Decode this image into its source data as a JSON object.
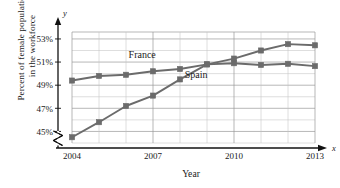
{
  "chart_data": {
    "type": "line",
    "title": "",
    "xlabel": "Year",
    "ylabel_line1": "Percent of female population",
    "ylabel_line2": "in the workforce",
    "x_axis_name": "x",
    "y_axis_name": "y",
    "x": [
      2004,
      2005,
      2006,
      2007,
      2008,
      2009,
      2010,
      2011,
      2012,
      2013
    ],
    "xtick_labels": [
      "2004",
      "2007",
      "2010",
      "2013"
    ],
    "xticks": [
      2004,
      2007,
      2010,
      2013
    ],
    "ytick_labels": [
      "45%",
      "47%",
      "49%",
      "51%",
      "53%"
    ],
    "yticks": [
      45,
      47,
      49,
      51,
      53
    ],
    "xlim": [
      2004,
      2013
    ],
    "ylim": [
      44,
      53.6
    ],
    "grid": true,
    "grid_minor_y_step": 1,
    "axis_break": true,
    "legend_position": "inline-annotations",
    "series": [
      {
        "name": "France",
        "color": "#6b6b6b",
        "label_x": 2006.6,
        "label_y": 51.35,
        "values": [
          49.4,
          49.8,
          49.9,
          50.2,
          50.4,
          50.8,
          50.9,
          50.75,
          50.85,
          50.65
        ]
      },
      {
        "name": "Spain",
        "color": "#6b6b6b",
        "label_x": 2008.6,
        "label_y": 49.6,
        "values": [
          44.5,
          45.8,
          47.2,
          48.1,
          49.5,
          50.8,
          51.3,
          52.0,
          52.55,
          52.45
        ]
      }
    ]
  },
  "axis": {
    "ytick_0": "45%",
    "ytick_1": "47%",
    "ytick_2": "49%",
    "ytick_3": "51%",
    "ytick_4": "53%",
    "xtick_0": "2004",
    "xtick_1": "2007",
    "xtick_2": "2010",
    "xtick_3": "2013"
  },
  "labels": {
    "france": "France",
    "spain": "Spain",
    "x_name": "x",
    "y_name": "y",
    "x_title": "Year",
    "y_title_line1": "Percent of female population",
    "y_title_line2": "in the workforce"
  }
}
